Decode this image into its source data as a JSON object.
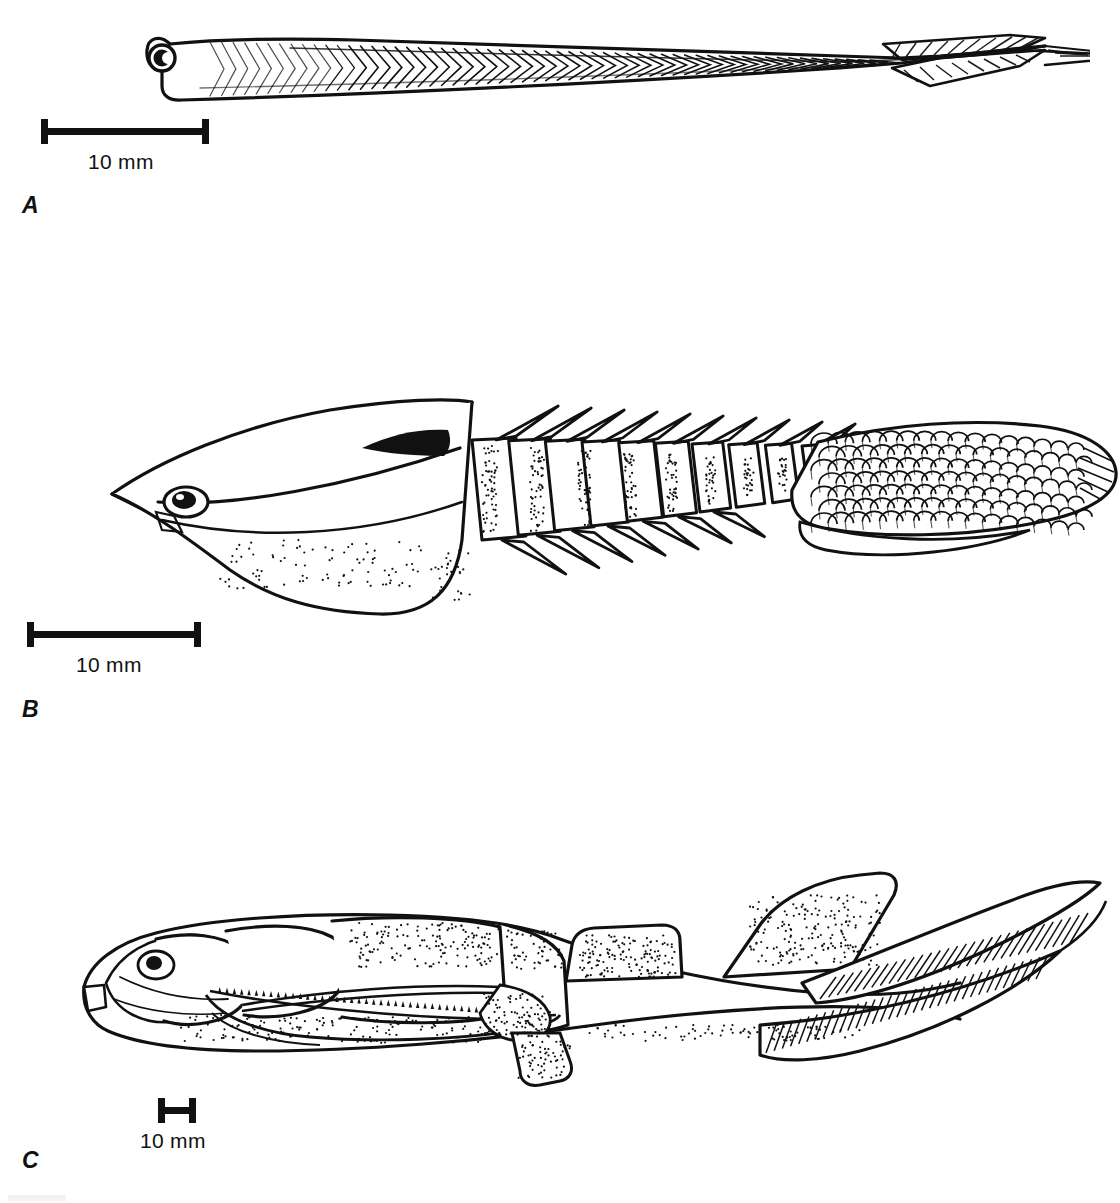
{
  "figure": {
    "kind": "scientific-illustration-plate",
    "background_color": "#ffffff",
    "ink_color": "#111111",
    "width": 1120,
    "height": 1203,
    "view": "lateral",
    "panel_count": 3
  },
  "panels": [
    {
      "id": "A",
      "label": "A",
      "label_x": 22,
      "label_y": 192,
      "subject": "slender eel-like jawless animal with chevron myomeres and hypocercal tail fin",
      "drawing": {
        "x": 140,
        "y": 8,
        "width": 950,
        "height": 110,
        "features": [
          "large round eye with crescent pupil at anterior end",
          "rounded snout / oral hood",
          "about 60 V-shaped (chevron) myomere blocks along body",
          "dorsal midline ridge running full length",
          "hatched dorsal and ventral caudal fin lobes at posterior",
          "tapering pointed tail tip"
        ]
      },
      "scale": {
        "text": "10 mm",
        "bar_x": 41,
        "bar_y": 119,
        "bar_width": 168,
        "label_x": 88,
        "label_y": 150
      }
    },
    {
      "id": "B",
      "label": "B",
      "label_x": 22,
      "label_y": 696,
      "subject": "armoured segmented fish with spined trunk plates and scaled tail",
      "drawing": {
        "x": 100,
        "y": 390,
        "width": 1020,
        "height": 250,
        "features": [
          "pointed rostrum with sharp anterior tip",
          "large oval eye with dark pupil behind rostrum",
          "broad smooth head shield / carapace",
          "dark solid black marking on posterior dorsal edge of head shield",
          "about 10 trunk segments, each with a backward-pointing dorsal spine",
          "about 7 ventral backward-pointing spines on lower trunk margin",
          "stippled shading along segment boundaries",
          "posterior third covered in overlapping rounded scales",
          "elongate scaled tail ending in a pointed hatched tip"
        ]
      },
      "scale": {
        "text": "10 mm",
        "bar_x": 27,
        "bar_y": 622,
        "bar_width": 174,
        "label_x": 76,
        "label_y": 653
      }
    },
    {
      "id": "C",
      "label": "C",
      "label_x": 22,
      "label_y": 1147,
      "subject": "armoured placoderm-like fish with bony head plates, paired fins and heterocercal tail",
      "drawing": {
        "x": 60,
        "y": 865,
        "width": 1060,
        "height": 235,
        "features": [
          "armoured head with sutured bony plates",
          "oval eye / orbit near front of head",
          "toothed gnathal plate along jaw margin",
          "blunt rostral plate at snout tip",
          "stippled shading over thoracic armour",
          "first dorsal fin, rectangular, mid-body",
          "second dorsal fin, larger and swept back",
          "long pectoral fin spine projecting forward beneath body",
          "small pelvic fin on ventral margin",
          "heterocercal tail with hatched dorsal and ventral caudal lobes",
          "long upturned tail filament"
        ]
      },
      "scale": {
        "text": "10 mm",
        "bar_x": 158,
        "bar_y": 1098,
        "bar_width": 38,
        "label_x": 140,
        "label_y": 1129
      }
    }
  ]
}
